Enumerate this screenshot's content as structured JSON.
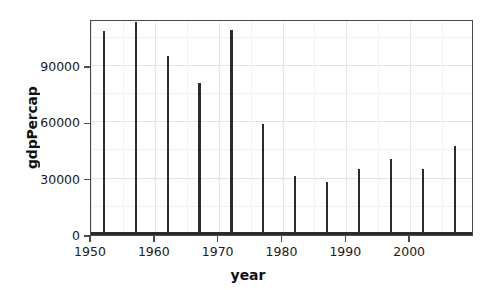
{
  "chart_data": {
    "type": "bar",
    "title": "",
    "xlabel": "year",
    "ylabel": "gdpPercap",
    "xlim": [
      1950,
      2010
    ],
    "ylim": [
      0,
      115000
    ],
    "grid": true,
    "legend": null,
    "x_ticks": [
      1950,
      1960,
      1970,
      1980,
      1990,
      2000
    ],
    "y_ticks": [
      0,
      30000,
      60000,
      90000
    ],
    "x_tick_labels": [
      "1950",
      "1960",
      "1970",
      "1980",
      "1990",
      "2000"
    ],
    "y_tick_labels": [
      "0",
      "30000",
      "60000",
      "90000"
    ],
    "x": [
      1952,
      1957,
      1962,
      1967,
      1972,
      1977,
      1982,
      1987,
      1992,
      1997,
      2002,
      2007
    ],
    "categories": [
      "1952",
      "1957",
      "1962",
      "1967",
      "1972",
      "1977",
      "1982",
      "1987",
      "1992",
      "1997",
      "2002",
      "2007"
    ],
    "values": [
      108382,
      113523,
      95458,
      80895,
      109348,
      59265,
      31354,
      28118,
      34933,
      40300,
      35110,
      47307
    ],
    "bar_color": "#2b2b2b"
  },
  "axes": {
    "y_title": "gdpPercap",
    "x_title": "year"
  }
}
